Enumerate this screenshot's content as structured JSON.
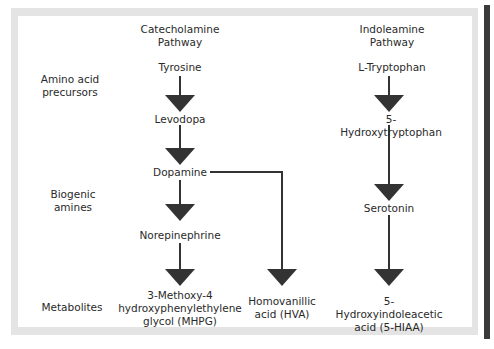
{
  "columns": {
    "catecholamine": {
      "title": "Catecholamine\nPathway"
    },
    "indoleamine": {
      "title": "Indoleamine\nPathway"
    }
  },
  "row_labels": {
    "amino_acid_precursors": "Amino acid\nprecursors",
    "biogenic_amines": "Biogenic\namines",
    "metabolites": "Metabolites"
  },
  "nodes": {
    "tyrosine": "Tyrosine",
    "levodopa": "Levodopa",
    "dopamine": "Dopamine",
    "norepinephrine": "Norepinephrine",
    "mhpg": "3-Methoxy-4\nhydroxyphenylethylene\nglycol (MHPG)",
    "hva": "Homovanillic\nacid (HVA)",
    "l_tryptophan": "L-Tryptophan",
    "hydroxytryptophan": "5-Hydroxytryptophan",
    "serotonin": "Serotonin",
    "hiaa": "5-Hydroxyindoleacetic\nacid (5-HIAA)"
  },
  "edges": [
    {
      "from": "Tyrosine",
      "to": "Levodopa"
    },
    {
      "from": "Levodopa",
      "to": "Dopamine"
    },
    {
      "from": "Dopamine",
      "to": "Norepinephrine"
    },
    {
      "from": "Norepinephrine",
      "to": "3-Methoxy-4 hydroxyphenylethylene glycol (MHPG)"
    },
    {
      "from": "Dopamine",
      "to": "Homovanillic acid (HVA)"
    },
    {
      "from": "L-Tryptophan",
      "to": "5-Hydroxytryptophan"
    },
    {
      "from": "5-Hydroxytryptophan",
      "to": "Serotonin"
    },
    {
      "from": "Serotonin",
      "to": "5-Hydroxyindoleacetic acid (5-HIAA)"
    }
  ],
  "colors": {
    "arrow": "#333333",
    "frame": "#e4e4e4",
    "edge_bar": "#3a3a3a",
    "text": "#2a2a2a"
  }
}
